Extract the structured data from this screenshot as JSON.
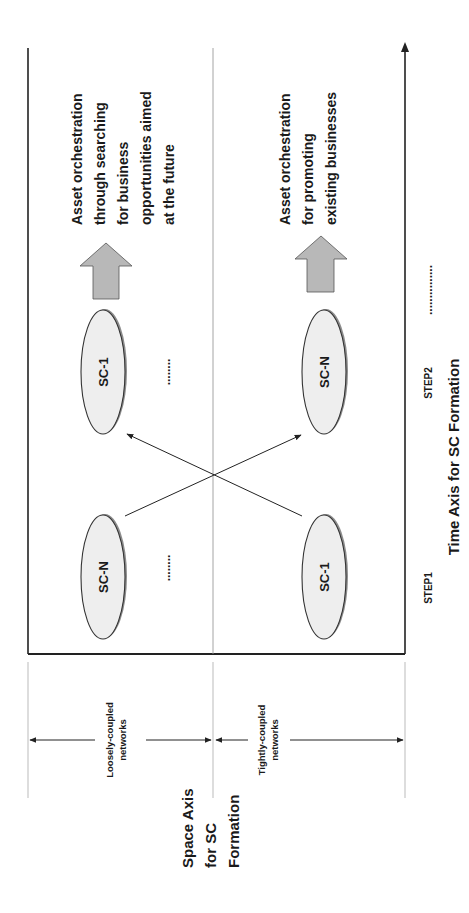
{
  "diagram": {
    "orientation": "rotated-90-ccw",
    "colors": {
      "line": "#222222",
      "thin_line": "#9a9a9a",
      "ellipse_fill": "#eeeeee",
      "ellipse_shadow": "#8c8c8c",
      "block_arrow_fill": "#b8b8b8"
    },
    "rows": {
      "loosely": {
        "label_line1": "Loosely-coupled",
        "label_line2": "networks",
        "step1_node": "SC-N",
        "step2_node": "SC-1",
        "outcome_lines": [
          "Asset orchestration",
          "through searching",
          "for business",
          "opportunities aimed",
          "at the future"
        ]
      },
      "tightly": {
        "label_line1": "Tightly-coupled",
        "label_line2": "networks",
        "step1_node": "SC-1",
        "step2_node": "SC-N",
        "outcome_lines": [
          "Asset orchestration",
          "for promoting",
          "existing businesses"
        ]
      }
    },
    "ellipsis": "........",
    "time_axis": {
      "step1": "STEP1",
      "step2": "STEP2",
      "continuation": "...............",
      "title": "Time Axis for SC Formation"
    },
    "space_axis": {
      "title_lines": [
        "Space Axis",
        "for SC",
        "Formation"
      ]
    }
  }
}
